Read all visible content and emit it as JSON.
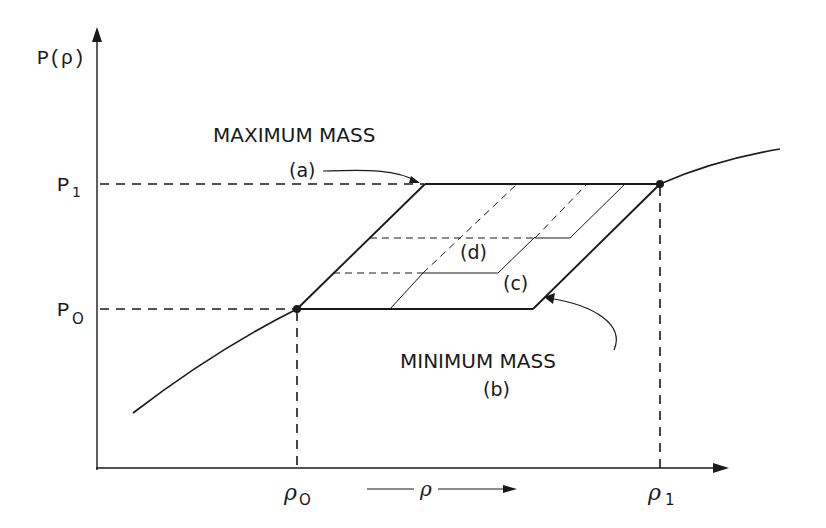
{
  "diagram": {
    "type": "pressure-density phase diagram",
    "axes": {
      "y_label": "P(ρ)",
      "x_label": "ρ",
      "y_ticks": [
        {
          "label_base": "P",
          "label_sub": "1"
        },
        {
          "label_base": "P",
          "label_sub": "O"
        }
      ],
      "x_ticks": [
        {
          "label_base": "ρ",
          "label_sub": "O"
        },
        {
          "label_base": "ρ",
          "label_sub": "1"
        }
      ]
    },
    "annotations": {
      "max_mass": "MAXIMUM MASS",
      "max_mass_tag": "(a)",
      "min_mass": "MINIMUM MASS",
      "min_mass_tag": "(b)",
      "c_tag": "(c)",
      "d_tag": "(d)"
    },
    "colors": {
      "ink": "#1a1a1a",
      "background": "#ffffff"
    }
  }
}
